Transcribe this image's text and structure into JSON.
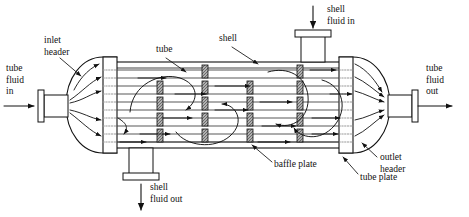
{
  "diagram": {
    "stroke_color": "#1a1a1a",
    "baffle_fill": "#b8b8b8",
    "background": "#ffffff"
  },
  "labels": {
    "tube_fluid_in": {
      "lines": [
        "tube",
        "fluid",
        "in"
      ],
      "x": 6,
      "y": 66
    },
    "tube_fluid_out": {
      "lines": [
        "tube",
        "fluid",
        "out"
      ],
      "x": 424,
      "y": 66
    },
    "inlet_header": {
      "lines": [
        "inlet",
        "header"
      ],
      "x": 44,
      "y": 38
    },
    "outlet_header": {
      "lines": [
        "outlet",
        "header"
      ],
      "x": 378,
      "y": 158
    },
    "tube": {
      "lines": [
        "tube"
      ],
      "x": 159,
      "y": 48
    },
    "shell": {
      "lines": [
        "shell"
      ],
      "x": 222,
      "y": 36
    },
    "shell_fluid_in": {
      "lines": [
        "shell",
        "fluid in"
      ],
      "x": 327,
      "y": 6
    },
    "shell_fluid_out": {
      "lines": [
        "shell",
        "fluid out"
      ],
      "x": 146,
      "y": 184
    },
    "baffle_plate": {
      "lines": [
        "baffle plate"
      ],
      "x": 273,
      "y": 162
    },
    "tube_plate": {
      "lines": [
        "tube plate"
      ],
      "x": 359,
      "y": 175
    }
  },
  "geometry": {
    "shell": {
      "x": 112,
      "y": 62,
      "width": 232,
      "height": 86
    },
    "tube_plate_left": {
      "x": 103,
      "y": 57,
      "width": 14,
      "height": 96
    },
    "tube_plate_right": {
      "x": 339,
      "y": 57,
      "width": 14,
      "height": 96
    },
    "tube_rows_y": [
      70,
      78,
      86,
      94,
      102,
      110,
      118,
      126,
      134,
      142
    ],
    "baffle_columns_x": [
      160,
      205,
      250,
      300
    ],
    "nozzle_shell_in": {
      "x": 300,
      "y": 30,
      "width": 26,
      "height": 32
    },
    "nozzle_shell_out": {
      "x": 128,
      "y": 148,
      "width": 26,
      "height": 32
    },
    "header_left": {
      "cx": 100,
      "cy": 105,
      "rx": 38,
      "ry": 48
    },
    "header_right": {
      "cx": 356,
      "cy": 105,
      "rx": 38,
      "ry": 48
    },
    "nozzle_tube_in": {
      "x": 36,
      "y": 96,
      "width": 30,
      "height": 20
    },
    "nozzle_tube_out": {
      "x": 390,
      "y": 96,
      "width": 30,
      "height": 20
    }
  },
  "flow": {
    "tube_side_arrow_count": 5,
    "shell_side_passes": 3,
    "tube_side_direction": "left-to-right",
    "shell_side_direction": "serpentine"
  }
}
